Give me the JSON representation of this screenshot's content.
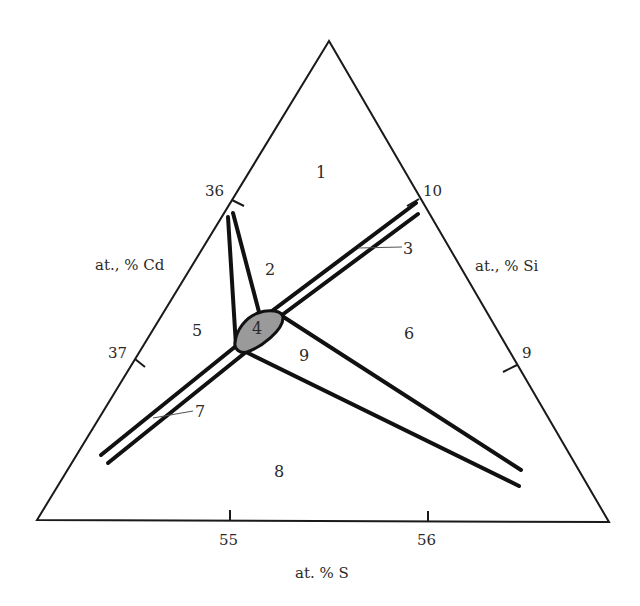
{
  "diagram": {
    "type": "ternary-phase-diagram-section",
    "axes": {
      "left": {
        "title": "at., % Cd",
        "ticks": [
          "36",
          "37"
        ]
      },
      "right": {
        "title": "at., % Si",
        "ticks": [
          "10",
          "9"
        ]
      },
      "bottom": {
        "title": "at. % S",
        "ticks": [
          "55",
          "56"
        ]
      }
    },
    "regions": [
      {
        "id": "1",
        "label": "1"
      },
      {
        "id": "2",
        "label": "2"
      },
      {
        "id": "3",
        "label": "3"
      },
      {
        "id": "4",
        "label": "4",
        "fill": "#9a9a9a"
      },
      {
        "id": "5",
        "label": "5"
      },
      {
        "id": "6",
        "label": "6"
      },
      {
        "id": "7",
        "label": "7"
      },
      {
        "id": "8",
        "label": "8"
      },
      {
        "id": "9",
        "label": "9"
      }
    ],
    "colors": {
      "lines": "#111111",
      "central_phase": "#9a9a9a",
      "background": "#ffffff"
    }
  }
}
